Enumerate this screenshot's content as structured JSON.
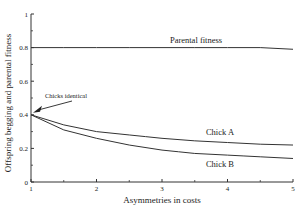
{
  "chart_data": {
    "type": "line",
    "title": "",
    "xlabel": "Asymmetries in costs",
    "ylabel": "Offspring begging and parental fitness",
    "xlim": [
      1,
      5
    ],
    "ylim": [
      0,
      1
    ],
    "xticks": [
      "1",
      "2",
      "3",
      "4",
      "5"
    ],
    "yticks": [
      "0",
      "0.2",
      "0.4",
      "0.6",
      "0.8",
      "1"
    ],
    "grid": false,
    "legend": "inline labels",
    "x": [
      1,
      1.5,
      2,
      2.5,
      3,
      3.5,
      4,
      4.5,
      5
    ],
    "series": [
      {
        "name": "Parental fitness",
        "values": [
          0.8,
          0.8,
          0.8,
          0.8,
          0.8,
          0.8,
          0.8,
          0.8,
          0.79
        ]
      },
      {
        "name": "Chick A",
        "values": [
          0.4,
          0.34,
          0.3,
          0.28,
          0.26,
          0.245,
          0.235,
          0.225,
          0.22
        ]
      },
      {
        "name": "Chick B",
        "values": [
          0.4,
          0.31,
          0.26,
          0.22,
          0.19,
          0.17,
          0.16,
          0.15,
          0.14
        ]
      }
    ],
    "annotations": [
      {
        "text": "Chicks identical",
        "x": 1,
        "y": 0.4,
        "arrow": true
      }
    ]
  }
}
